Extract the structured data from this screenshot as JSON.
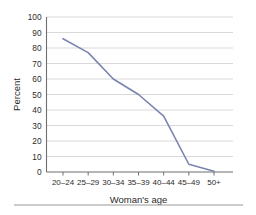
{
  "chart_data": {
    "type": "line",
    "title": "",
    "subtitle": "",
    "xlabel": "Woman's age",
    "ylabel": "Percent",
    "categories": [
      "20–24",
      "25–29",
      "30–34",
      "35–39",
      "40–44",
      "45–49",
      "50+"
    ],
    "values": [
      86,
      77,
      60,
      50,
      36,
      5,
      0.5
    ],
    "series": [
      {
        "name": "Percent",
        "values": [
          86,
          77,
          60,
          50,
          36,
          5,
          0.5
        ]
      }
    ],
    "ylim": [
      0,
      100
    ],
    "ytick_values": [
      0,
      10,
      20,
      30,
      40,
      50,
      60,
      70,
      80,
      90,
      100
    ],
    "ytick_labels": [
      "0",
      "10",
      "20",
      "30",
      "40",
      "50",
      "60",
      "70",
      "80",
      "90",
      "100"
    ],
    "grid": "horizontal",
    "legend": "none",
    "legend_position": "none",
    "annotations": [],
    "line_color": "#7b84b0",
    "grid_color": "#c9c9c9",
    "axis_color": "#6f6f6f",
    "text_color": "#2b2b2b"
  }
}
